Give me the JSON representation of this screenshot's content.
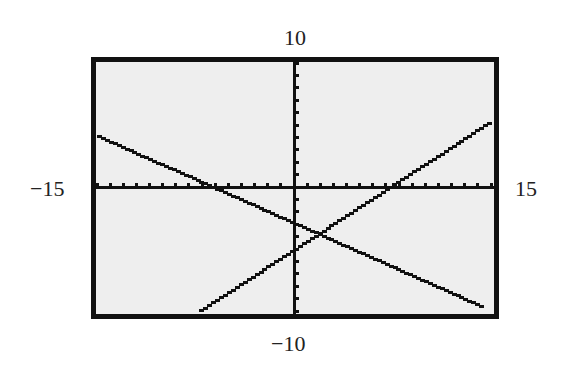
{
  "chart_data": {
    "type": "line",
    "title": "",
    "xlabel": "",
    "ylabel": "",
    "window": {
      "xmin": -15,
      "xmax": 15,
      "ymin": -10,
      "ymax": 10,
      "xscl": 1,
      "yscl": 1
    },
    "xlim": [
      -15,
      15
    ],
    "ylim": [
      -10,
      10
    ],
    "grid": false,
    "axes": true,
    "legend": null,
    "tick_labels": {
      "top": "10",
      "bottom": "−10",
      "left": "−15",
      "right": "15"
    },
    "series": [
      {
        "name": "line-decreasing",
        "slope": -0.47,
        "intercept": -3,
        "x": [
          -15,
          -7.3,
          0,
          1.8,
          14.4
        ],
        "y": [
          4.0,
          0,
          -3.0,
          -3.8,
          -9.8
        ]
      },
      {
        "name": "line-increasing",
        "slope": 0.69,
        "intercept": -5,
        "x": [
          -7.2,
          0,
          1.8,
          7.3,
          15
        ],
        "y": [
          -10,
          -5.0,
          -3.8,
          0,
          5.3
        ]
      }
    ],
    "annotations": [
      {
        "type": "intersection",
        "x": 1.8,
        "y": -3.8
      }
    ]
  },
  "labels": {
    "top": "10",
    "bottom": "−10",
    "left": "−15",
    "right": "15"
  },
  "colors": {
    "screen_bg": "#eeeeee",
    "ink": "#111111",
    "page_bg": "#ffffff"
  }
}
